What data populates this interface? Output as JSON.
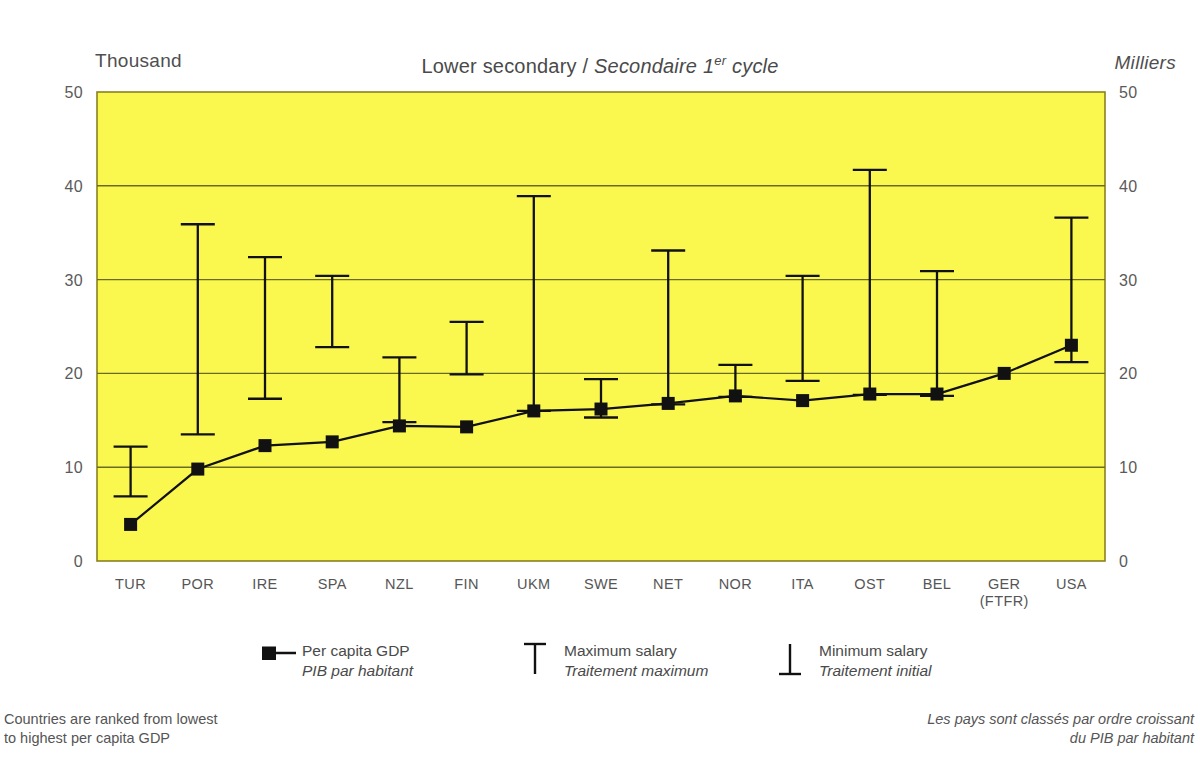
{
  "title": {
    "english": "Lower secondary",
    "separator": " / ",
    "french_pre": "Secondaire 1",
    "french_sup": "er",
    "french_post": " cycle"
  },
  "axis": {
    "unit_left": "Thousand",
    "unit_right": "Milliers",
    "y_ticks": [
      "50",
      "40",
      "30",
      "20",
      "10",
      "0"
    ],
    "y_min": 0,
    "y_max": 50
  },
  "legend": {
    "gdp": {
      "en": "Per capita GDP",
      "fr": "PIB par habitant",
      "symbol": "square-with-line"
    },
    "max": {
      "en": "Maximum salary",
      "fr": "Traitement maximum",
      "symbol": "top-tick"
    },
    "min": {
      "en": "Minimum salary",
      "fr": "Traitement initial",
      "symbol": "bottom-tick"
    }
  },
  "notes": {
    "left": "Countries are ranked from lowest\nto highest per capita GDP",
    "right": "Les pays sont classés par ordre croissant\ndu PIB par habitant"
  },
  "colors": {
    "plot_background": "#faf84f",
    "plot_border": "#8a8020",
    "gridline": "#6a6a20",
    "data": "#111111",
    "text": "#4a4a4a"
  },
  "chart_data": {
    "type": "line",
    "title": "Lower secondary / Secondaire 1er cycle",
    "xlabel": "",
    "ylabel": "Thousand",
    "ylim": [
      0,
      50
    ],
    "grid": true,
    "categories": [
      "TUR",
      "POR",
      "IRE",
      "SPA",
      "NZL",
      "FIN",
      "UKM",
      "SWE",
      "NET",
      "NOR",
      "ITA",
      "OST",
      "BEL",
      "GER\n(FTFR)",
      "USA"
    ],
    "category_labels": [
      {
        "line1": "TUR",
        "line2": ""
      },
      {
        "line1": "POR",
        "line2": ""
      },
      {
        "line1": "IRE",
        "line2": ""
      },
      {
        "line1": "SPA",
        "line2": ""
      },
      {
        "line1": "NZL",
        "line2": ""
      },
      {
        "line1": "FIN",
        "line2": ""
      },
      {
        "line1": "UKM",
        "line2": ""
      },
      {
        "line1": "SWE",
        "line2": ""
      },
      {
        "line1": "NET",
        "line2": ""
      },
      {
        "line1": "NOR",
        "line2": ""
      },
      {
        "line1": "ITA",
        "line2": ""
      },
      {
        "line1": "OST",
        "line2": ""
      },
      {
        "line1": "BEL",
        "line2": ""
      },
      {
        "line1": "GER",
        "line2": "(FTFR)"
      },
      {
        "line1": "USA",
        "line2": ""
      }
    ],
    "series": [
      {
        "name": "Per capita GDP",
        "name_fr": "PIB par habitant",
        "values": [
          3.9,
          9.8,
          12.3,
          12.7,
          14.4,
          14.3,
          16.0,
          16.2,
          16.8,
          17.6,
          17.1,
          17.8,
          17.8,
          20.0,
          23.0
        ]
      },
      {
        "name": "Maximum salary",
        "name_fr": "Traitement maximum",
        "values": [
          12.2,
          35.9,
          32.4,
          30.4,
          21.7,
          25.5,
          38.9,
          19.4,
          33.1,
          20.9,
          30.4,
          41.7,
          30.9,
          null,
          36.6
        ]
      },
      {
        "name": "Minimum salary",
        "name_fr": "Traitement initial",
        "values": [
          6.9,
          13.5,
          17.3,
          22.8,
          14.8,
          19.9,
          16.0,
          15.3,
          16.7,
          17.5,
          19.2,
          17.7,
          17.6,
          null,
          21.2
        ]
      }
    ]
  }
}
